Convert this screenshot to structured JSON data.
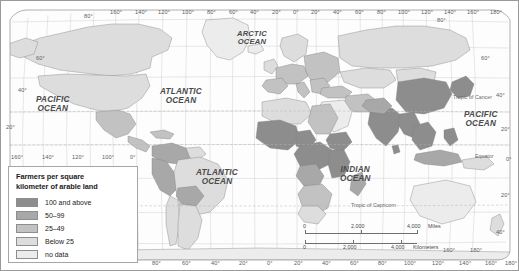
{
  "map": {
    "title": "World map of farmers per square kilometer of arable land",
    "projection": "Robinson",
    "background_color": "#ffffff",
    "border_color": "#9a9a9a",
    "ocean_color": "#ffffff",
    "graticule_color": "#c0c0c0"
  },
  "legend": {
    "title_line1": "Farmers per square",
    "title_line2": "kilometer of arable land",
    "items": [
      {
        "label": "100 and above",
        "color": "#8d8d8d"
      },
      {
        "label": "50–99",
        "color": "#a8a8a8"
      },
      {
        "label": "25–49",
        "color": "#c2c2c2"
      },
      {
        "label": "Below 25",
        "color": "#dddddd"
      },
      {
        "label": "no data",
        "color": "#ececec"
      }
    ]
  },
  "ocean_labels": [
    {
      "name": "arctic-ocean",
      "line1": "ARCTIC",
      "line2": "OCEAN",
      "x": 237,
      "y": 30,
      "size": "mid"
    },
    {
      "name": "atlantic-ocean-north",
      "line1": "ATLANTIC",
      "line2": "OCEAN",
      "x": 160,
      "y": 88,
      "size": "big"
    },
    {
      "name": "atlantic-ocean-south",
      "line1": "ATLANTIC",
      "line2": "OCEAN",
      "x": 196,
      "y": 169,
      "size": "big"
    },
    {
      "name": "pacific-ocean-west",
      "line1": "PACIFIC",
      "line2": "OCEAN",
      "x": 36,
      "y": 96,
      "size": "big"
    },
    {
      "name": "pacific-ocean-east",
      "line1": "PACIFIC",
      "line2": "OCEAN",
      "x": 464,
      "y": 111,
      "size": "big"
    },
    {
      "name": "indian-ocean",
      "line1": "INDIAN",
      "line2": "OCEAN",
      "x": 340,
      "y": 166,
      "size": "big"
    }
  ],
  "reference_lines": [
    {
      "name": "tropic-of-cancer",
      "label": "Tropic of Cancer",
      "x": 453,
      "y": 95
    },
    {
      "name": "equator",
      "label": "Equator",
      "x": 475,
      "y": 154
    },
    {
      "name": "tropic-of-capricorn",
      "label": "Tropic of Capricorn",
      "x": 351,
      "y": 203
    }
  ],
  "longitude_labels_top": [
    {
      "label": "160°",
      "x": 110
    },
    {
      "label": "140°",
      "x": 135
    },
    {
      "label": "120°",
      "x": 158
    },
    {
      "label": "100°",
      "x": 182
    },
    {
      "label": "80°",
      "x": 207
    },
    {
      "label": "60°",
      "x": 229
    },
    {
      "label": "40°",
      "x": 250
    },
    {
      "label": "20°",
      "x": 272
    },
    {
      "label": "0°",
      "x": 293
    },
    {
      "label": "20°",
      "x": 311
    },
    {
      "label": "40°",
      "x": 333
    },
    {
      "label": "60°",
      "x": 355
    },
    {
      "label": "80°",
      "x": 377
    },
    {
      "label": "100°",
      "x": 398
    },
    {
      "label": "120°",
      "x": 421
    },
    {
      "label": "140°",
      "x": 444
    },
    {
      "label": "160°",
      "x": 467
    },
    {
      "label": "180°",
      "x": 490
    }
  ],
  "longitude_labels_bottom": [
    {
      "label": "80°",
      "x": 152
    },
    {
      "label": "60°",
      "x": 182
    },
    {
      "label": "40°",
      "x": 211
    },
    {
      "label": "20°",
      "x": 239
    },
    {
      "label": "0°",
      "x": 267
    },
    {
      "label": "20°",
      "x": 294
    },
    {
      "label": "40°",
      "x": 322
    },
    {
      "label": "60°",
      "x": 350
    },
    {
      "label": "80°",
      "x": 378
    },
    {
      "label": "100°",
      "x": 404
    },
    {
      "label": "120°",
      "x": 432
    },
    {
      "label": "140°",
      "x": 459
    },
    {
      "label": "160°",
      "x": 485
    },
    {
      "label": "180°",
      "x": 505
    }
  ],
  "longitude_labels_interior": [
    {
      "label": "160°",
      "x": 11
    },
    {
      "label": "140°",
      "x": 42
    },
    {
      "label": "120°",
      "x": 72
    },
    {
      "label": "100°",
      "x": 102
    },
    {
      "label": "0°",
      "x": 130
    }
  ],
  "longitude_labels_bottom_right": [
    {
      "label": "160°",
      "x": 443
    },
    {
      "label": "180°",
      "x": 470
    }
  ],
  "latitude_labels_left": [
    {
      "label": "60°",
      "x": 36,
      "y": 56
    },
    {
      "label": "40°",
      "x": 18,
      "y": 88
    },
    {
      "label": "20°",
      "x": 6,
      "y": 125
    },
    {
      "label": "80°",
      "x": 84,
      "y": 14
    }
  ],
  "latitude_labels_right": [
    {
      "label": "60°",
      "x": 481,
      "y": 56
    },
    {
      "label": "40°",
      "x": 496,
      "y": 93
    },
    {
      "label": "20°",
      "x": 501,
      "y": 127
    },
    {
      "label": "0°",
      "x": 506,
      "y": 157
    },
    {
      "label": "20°",
      "x": 501,
      "y": 193
    },
    {
      "label": "40°",
      "x": 496,
      "y": 230
    },
    {
      "label": "80°",
      "x": 437,
      "y": 18
    }
  ],
  "scale_bar": {
    "miles": {
      "unit": "Miles",
      "ticks": [
        {
          "label": "0",
          "x": 0
        },
        {
          "label": "2,000",
          "x": 56
        },
        {
          "label": "4,000",
          "x": 112
        }
      ]
    },
    "kilometers": {
      "unit": "Kilometers",
      "ticks": [
        {
          "label": "0",
          "x": 0
        },
        {
          "label": "2,000",
          "x": 48
        },
        {
          "label": "4,000",
          "x": 96
        }
      ]
    }
  }
}
